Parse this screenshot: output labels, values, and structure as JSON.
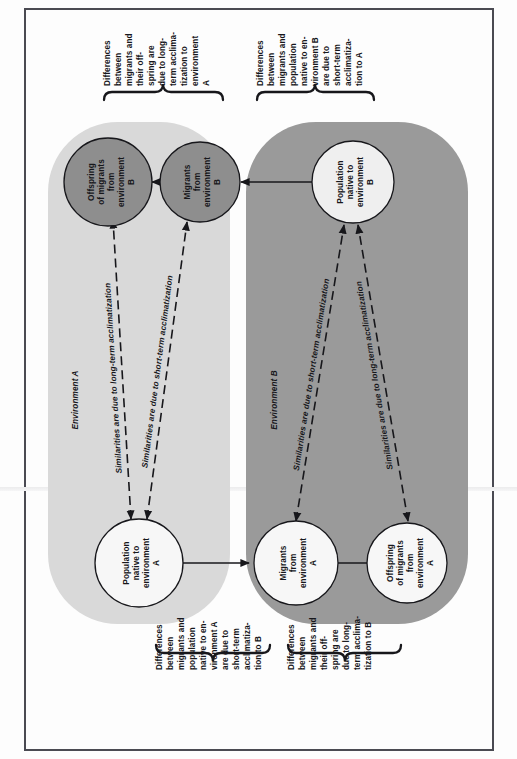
{
  "figure": {
    "orientation": "rotated-90-ccw",
    "colors": {
      "env_a_fill": "#d9d9d9",
      "env_b_fill": "#9a9a9a",
      "circle_dark": "#8e8e8e",
      "circle_light": "#efefef",
      "circle_white": "#f7f7f7",
      "stroke": "#17171b",
      "frame": "#4a4a52",
      "page": "#fdfdfd"
    }
  },
  "environments": [
    {
      "id": "env-a",
      "label": "Environment A",
      "fill": "#d9d9d9"
    },
    {
      "id": "env-b",
      "label": "Environment B",
      "fill": "#9a9a9a"
    }
  ],
  "nodes": [
    {
      "id": "offspring-migrants-b",
      "lines": [
        "Offspring",
        "of migrants",
        "from",
        "environment",
        "B"
      ],
      "fill": "#8e8e8e",
      "env": "env-a"
    },
    {
      "id": "migrants-b",
      "lines": [
        "Migrants",
        "from",
        "environment",
        "B"
      ],
      "fill": "#8e8e8e",
      "env": "env-a"
    },
    {
      "id": "population-native-b",
      "lines": [
        "Population",
        "native to",
        "environment",
        "B"
      ],
      "fill": "#efefef",
      "env": "env-b"
    },
    {
      "id": "population-native-a",
      "lines": [
        "Population",
        "native to",
        "environment",
        "A"
      ],
      "fill": "#f7f7f7",
      "env": "env-a"
    },
    {
      "id": "migrants-a",
      "lines": [
        "Migrants",
        "from",
        "environment",
        "A"
      ],
      "fill": "#f7f7f7",
      "env": "env-b"
    },
    {
      "id": "offspring-migrants-a",
      "lines": [
        "Offspring",
        "of migrants",
        "from",
        "environment",
        "A"
      ],
      "fill": "#f7f7f7",
      "env": "env-b"
    }
  ],
  "edge_labels": [
    {
      "id": "edge-long-term-a",
      "text": "Similarities are due to long-term acclimatization"
    },
    {
      "id": "edge-short-term-a",
      "text": "Similarities are due to short-term acclimatization"
    },
    {
      "id": "edge-short-term-b",
      "text": "Similarities are due to short-term acclimatization"
    },
    {
      "id": "edge-long-term-b",
      "text": "Similarities are due to long-term acclimatization"
    }
  ],
  "braces": [
    {
      "id": "brace-top-left",
      "lines": [
        "Differences",
        "between",
        "migrants and",
        "their off-",
        "spring are",
        "due to long-",
        "term acclima-",
        "tization to",
        "environment",
        "A"
      ]
    },
    {
      "id": "brace-top-right",
      "lines": [
        "Differences",
        "between",
        "migrants and",
        "population",
        "native to en-",
        "vironment B",
        "are due to",
        "short-term",
        "acclimatiza-",
        "tion to A"
      ]
    },
    {
      "id": "brace-bottom-left",
      "lines": [
        "Differences",
        "between",
        "migrants and",
        "population",
        "native to en-",
        "vironment A",
        "are due to",
        "short-term",
        "acclimatiza-",
        "tion to B"
      ]
    },
    {
      "id": "brace-bottom-right",
      "lines": [
        "Differences",
        "between",
        "migrants and",
        "their off-",
        "spring are",
        "due to long-",
        "term acclima-",
        "tization to B"
      ]
    }
  ]
}
